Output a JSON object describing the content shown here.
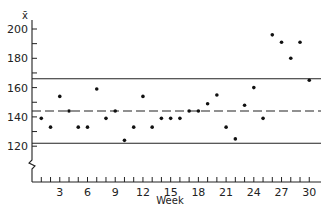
{
  "chart_data": {
    "type": "scatter",
    "title": "",
    "xlabel": "Week",
    "ylabel": "x̄",
    "xlim": [
      0,
      31
    ],
    "ylim": [
      100,
      210
    ],
    "axis_break_y": true,
    "grid": false,
    "x_ticks": [
      3,
      6,
      9,
      12,
      15,
      18,
      21,
      24,
      27,
      30
    ],
    "y_ticks": [
      120,
      140,
      160,
      180,
      200
    ],
    "x": [
      1,
      2,
      3,
      4,
      5,
      6,
      7,
      8,
      9,
      10,
      11,
      12,
      13,
      14,
      15,
      16,
      17,
      18,
      19,
      20,
      21,
      22,
      23,
      24,
      25,
      26,
      27,
      28,
      29,
      30
    ],
    "values": [
      139,
      133,
      154,
      144,
      133,
      133,
      159,
      139,
      144,
      124,
      133,
      154,
      133,
      139,
      139,
      139,
      144,
      144,
      149,
      155,
      133,
      125,
      148,
      160,
      139,
      196,
      191,
      180,
      191,
      165
    ],
    "reference_lines": [
      {
        "name": "Upper control limit",
        "value": 166,
        "style": "solid"
      },
      {
        "name": "Center line",
        "value": 144,
        "style": "dashed"
      },
      {
        "name": "Lower control limit",
        "value": 122,
        "style": "solid"
      }
    ]
  },
  "labels": {
    "ylabel": "x̄",
    "xlabel": "Week"
  }
}
